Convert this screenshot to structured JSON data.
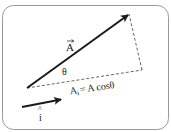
{
  "diagram": {
    "type": "vector-projection",
    "vector_label": "A",
    "angle_label": "θ",
    "projection_label": "A",
    "projection_subscript": "i",
    "projection_equation_rhs": "= A cosθ",
    "unit_vector_label": "i",
    "unit_vector_hat": "^",
    "colors": {
      "stroke": "#1a1a1a",
      "dashed": "#555555",
      "border": "#9a9a9a",
      "background": "#ffffff"
    }
  }
}
